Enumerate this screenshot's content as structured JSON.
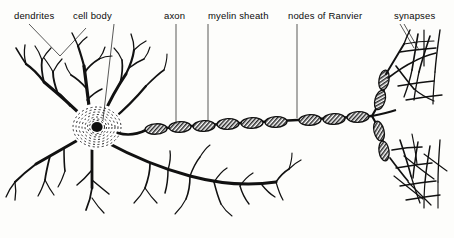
{
  "figure": {
    "background_color": "#fdfdfb",
    "ink_color": "#111111",
    "width": 454,
    "height": 238
  },
  "labels": [
    {
      "id": "dendrites",
      "text": "dendrites",
      "x": 14,
      "y": 10
    },
    {
      "id": "cell-body",
      "text": "cell body",
      "x": 73,
      "y": 10
    },
    {
      "id": "axon",
      "text": "axon",
      "x": 164,
      "y": 10
    },
    {
      "id": "myelin-sheath",
      "text": "myelin sheath",
      "x": 208,
      "y": 10
    },
    {
      "id": "nodes-of-ranvier",
      "text": "nodes of Ranvier",
      "x": 288,
      "y": 10
    },
    {
      "id": "synapses",
      "text": "synapses",
      "x": 394,
      "y": 10
    }
  ],
  "structures": {
    "soma": {
      "name": "cell body",
      "nucleus_color": "#111111",
      "ring_count": 7
    },
    "dendrite_count": 7,
    "myelin_segment_count": 16,
    "node_count": 15,
    "synapse_web": "terminal arborization"
  }
}
